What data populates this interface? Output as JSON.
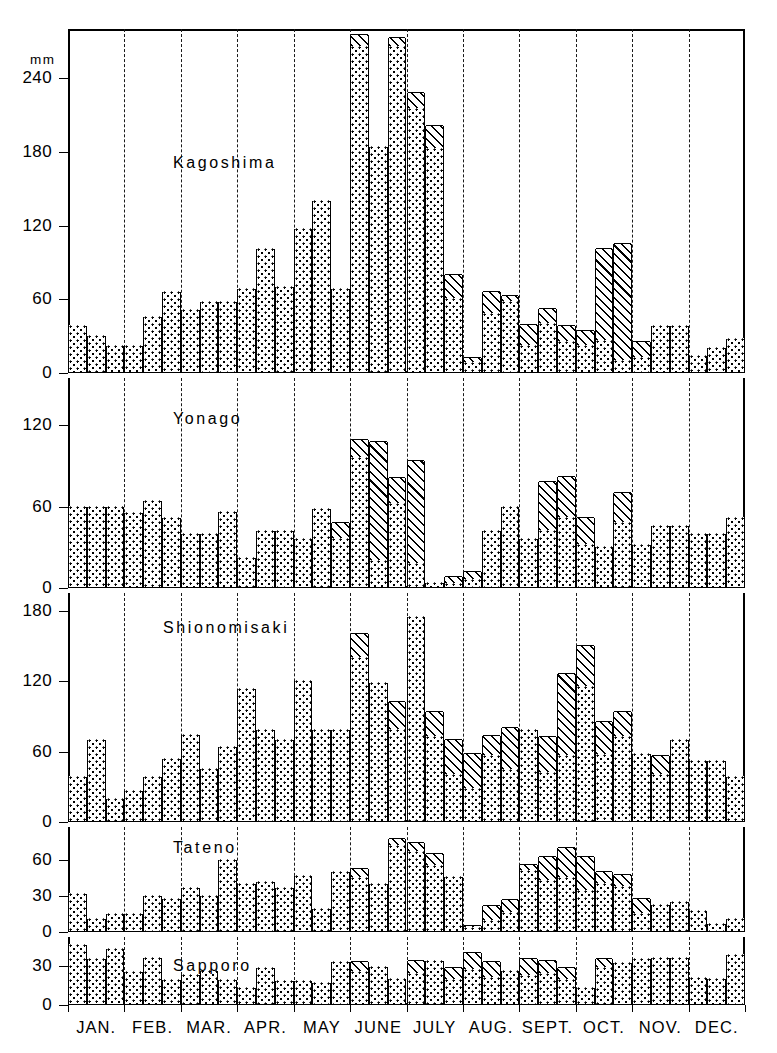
{
  "figure": {
    "unit_label": "mm",
    "x_axis": {
      "months": [
        "JAN.",
        "FEB.",
        "MAR.",
        "APR.",
        "MAY",
        "JUNE",
        "JULY",
        "AUG.",
        "SEPT.",
        "OCT.",
        "NOV.",
        "DEC."
      ],
      "periods_per_month": 3
    },
    "legend_patterns": {
      "dotted": "total precipitation",
      "hatched": "additional amount"
    }
  },
  "chart_data": [
    {
      "type": "bar",
      "title": "Kagoshima",
      "ylabel": "mm",
      "xlabel": "",
      "ylim": [
        0,
        280
      ],
      "yticks": [
        0,
        60,
        120,
        180,
        240
      ],
      "grid": false,
      "categories": [
        "JAN.",
        "FEB.",
        "MAR.",
        "APR.",
        "MAY",
        "JUNE",
        "JULY",
        "AUG.",
        "SEPT.",
        "OCT.",
        "NOV.",
        "DEC."
      ],
      "series": [
        {
          "name": "dotted",
          "values": [
            38,
            30,
            22,
            22,
            46,
            66,
            51,
            58,
            58,
            68,
            101,
            70,
            117,
            140,
            68,
            265,
            184,
            265,
            215,
            182,
            60,
            8,
            48,
            58,
            22,
            40,
            25,
            22,
            26,
            10,
            12,
            38,
            38,
            14,
            20,
            28
          ]
        },
        {
          "name": "hatched",
          "values": [
            0,
            0,
            0,
            0,
            0,
            0,
            0,
            0,
            0,
            0,
            0,
            0,
            0,
            0,
            0,
            10,
            0,
            8,
            13,
            19,
            20,
            4,
            18,
            5,
            17,
            12,
            13,
            12,
            75,
            95,
            13,
            0,
            0,
            0,
            0,
            0
          ]
        }
      ]
    },
    {
      "type": "bar",
      "title": "Yonago",
      "ylabel": "mm",
      "xlabel": "",
      "ylim": [
        0,
        155
      ],
      "yticks": [
        0,
        60,
        120
      ],
      "grid": false,
      "categories": [
        "JAN.",
        "FEB.",
        "MAR.",
        "APR.",
        "MAY",
        "JUNE",
        "JULY",
        "AUG.",
        "SEPT.",
        "OCT.",
        "NOV.",
        "DEC."
      ],
      "series": [
        {
          "name": "dotted",
          "values": [
            60,
            60,
            60,
            55,
            64,
            52,
            40,
            40,
            56,
            22,
            42,
            42,
            36,
            58,
            36,
            96,
            20,
            62,
            18,
            4,
            3,
            6,
            42,
            60,
            36,
            42,
            52,
            32,
            30,
            48,
            32,
            46,
            46,
            40,
            40,
            52
          ]
        },
        {
          "name": "hatched",
          "values": [
            0,
            0,
            0,
            0,
            0,
            0,
            0,
            0,
            0,
            0,
            0,
            0,
            0,
            0,
            12,
            13,
            88,
            19,
            76,
            0,
            5,
            6,
            0,
            0,
            0,
            36,
            30,
            20,
            0,
            22,
            0,
            0,
            0,
            0,
            0,
            0
          ]
        }
      ]
    },
    {
      "type": "bar",
      "title": "Shionomisaki",
      "ylabel": "mm",
      "xlabel": "",
      "ylim": [
        0,
        195
      ],
      "yticks": [
        0,
        60,
        120,
        180
      ],
      "grid": false,
      "categories": [
        "JAN.",
        "FEB.",
        "MAR.",
        "APR.",
        "MAY",
        "JUNE",
        "JULY",
        "AUG.",
        "SEPT.",
        "OCT.",
        "NOV.",
        "DEC."
      ],
      "series": [
        {
          "name": "dotted",
          "values": [
            38,
            70,
            20,
            26,
            38,
            54,
            74,
            45,
            64,
            113,
            78,
            70,
            120,
            78,
            78,
            140,
            118,
            78,
            175,
            72,
            40,
            28,
            56,
            44,
            78,
            42,
            56,
            115,
            57,
            72,
            58,
            40,
            70,
            52,
            52,
            38
          ]
        },
        {
          "name": "hatched",
          "values": [
            0,
            0,
            0,
            0,
            0,
            0,
            0,
            0,
            0,
            0,
            0,
            0,
            0,
            0,
            0,
            20,
            0,
            24,
            0,
            22,
            30,
            30,
            17,
            36,
            0,
            30,
            70,
            35,
            28,
            22,
            0,
            16,
            0,
            0,
            0,
            0
          ]
        }
      ]
    },
    {
      "type": "bar",
      "title": "Tateno",
      "ylabel": "mm",
      "xlabel": "",
      "ylim": [
        0,
        88
      ],
      "yticks": [
        0,
        30,
        60
      ],
      "grid": false,
      "categories": [
        "JAN.",
        "FEB.",
        "MAR.",
        "APR.",
        "MAY",
        "JUNE",
        "JULY",
        "AUG.",
        "SEPT.",
        "OCT.",
        "NOV.",
        "DEC."
      ],
      "series": [
        {
          "name": "dotted",
          "values": [
            32,
            11,
            15,
            15,
            30,
            28,
            37,
            30,
            60,
            40,
            42,
            37,
            47,
            19,
            50,
            45,
            40,
            72,
            67,
            55,
            46,
            3,
            9,
            16,
            51,
            43,
            45,
            34,
            40,
            38,
            15,
            23,
            25,
            18,
            7,
            11
          ]
        },
        {
          "name": "hatched",
          "values": [
            0,
            0,
            0,
            0,
            0,
            0,
            0,
            0,
            0,
            0,
            0,
            0,
            0,
            0,
            0,
            8,
            0,
            6,
            8,
            10,
            0,
            2,
            13,
            11,
            5,
            20,
            25,
            29,
            10,
            10,
            13,
            0,
            0,
            0,
            0,
            0
          ]
        }
      ]
    },
    {
      "type": "bar",
      "title": "Sapporo",
      "ylabel": "mm",
      "xlabel": "",
      "ylim": [
        0,
        52
      ],
      "yticks": [
        0,
        30
      ],
      "grid": false,
      "categories": [
        "JAN.",
        "FEB.",
        "MAR.",
        "APR.",
        "MAY",
        "JUNE",
        "JULY",
        "AUG.",
        "SEPT.",
        "OCT.",
        "NOV.",
        "DEC."
      ],
      "series": [
        {
          "name": "dotted",
          "values": [
            46,
            35,
            43,
            25,
            36,
            19,
            23,
            26,
            19,
            13,
            28,
            18,
            18,
            17,
            33,
            25,
            29,
            20,
            24,
            34,
            19,
            27,
            21,
            26,
            22,
            24,
            19,
            13,
            28,
            32,
            35,
            36,
            36,
            21,
            20,
            38
          ]
        },
        {
          "name": "hatched",
          "values": [
            0,
            0,
            0,
            0,
            0,
            0,
            0,
            0,
            0,
            0,
            0,
            0,
            0,
            0,
            0,
            8,
            0,
            0,
            10,
            0,
            9,
            13,
            12,
            0,
            13,
            10,
            9,
            0,
            7,
            0,
            0,
            0,
            0,
            0,
            0,
            0
          ]
        }
      ]
    }
  ]
}
